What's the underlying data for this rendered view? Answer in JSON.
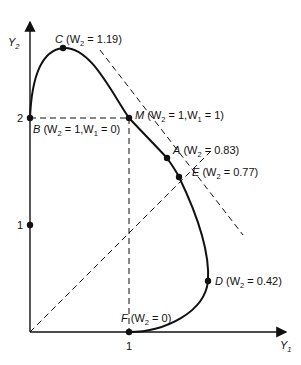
{
  "diagram": {
    "type": "frontier-curve",
    "axes": {
      "x_label": "Y",
      "x_sub": "1",
      "y_label": "Y",
      "y_sub": "2",
      "x_ticks": [
        "1"
      ],
      "y_ticks": [
        "1",
        "2"
      ]
    },
    "points": {
      "C": {
        "name": "C",
        "text_a": " (W",
        "sub": "2",
        "text_b": " = 1.19)"
      },
      "M": {
        "name": "M",
        "text_a": " (W",
        "sub": "2",
        "text_b": " = 1,W",
        "sub2": "1",
        "text_c": " = 1)"
      },
      "A": {
        "name": "A",
        "text_a": " (W",
        "sub": "2",
        "text_b": " = 0.83)"
      },
      "E": {
        "name": "E",
        "text_a": " (W",
        "sub": "2",
        "text_b": " = 0.77)"
      },
      "D": {
        "name": "D",
        "text_a": " (W",
        "sub": "2",
        "text_b": " = 0.42)"
      },
      "B": {
        "name": "B",
        "text_a": " (W",
        "sub": "2",
        "text_b": " = 1,W",
        "sub2": "1",
        "text_c": " = 0)"
      },
      "F": {
        "name": "F",
        "text_a": " (W",
        "sub": "2",
        "text_b": " = 0)"
      }
    },
    "colors": {
      "line": "#111111",
      "background": "#ffffff"
    }
  }
}
